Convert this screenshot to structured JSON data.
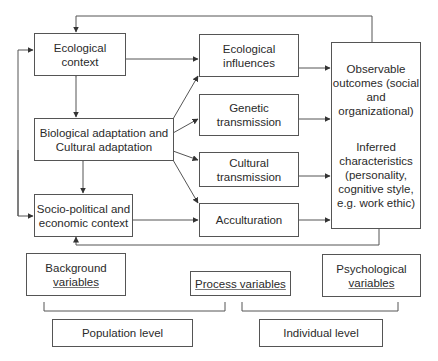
{
  "diagram": {
    "nodes": {
      "ecological_context": {
        "line1": "Ecological",
        "line2": "context"
      },
      "bio_cultural_adaptation": {
        "line1": "Biological adaptation and",
        "line2": "Cultural adaptation"
      },
      "sociopolitical_context": {
        "line1": "Socio-political and",
        "line2": "economic context"
      },
      "ecological_influences": {
        "line1": "Ecological",
        "line2": "influences"
      },
      "genetic_transmission": {
        "line1": "Genetic",
        "line2": "transmission"
      },
      "cultural_transmission": {
        "line1": "Cultural",
        "line2": "transmission"
      },
      "acculturation": {
        "line1": "Acculturation"
      },
      "outcomes": {
        "observable": [
          "Observable",
          "outcomes (social",
          "and",
          "organizational)"
        ],
        "inferred": [
          "Inferred",
          "characteristics",
          "(personality,",
          "cognitive style,",
          "e.g. work ethic)"
        ]
      }
    },
    "legend": {
      "background_variables": {
        "line1": "Background",
        "line2": "variables"
      },
      "process_variables": {
        "line1": "Process variables"
      },
      "psychological_variables": {
        "line1": "Psychological",
        "line2": "variables"
      },
      "population_level": {
        "line1": "Population level"
      },
      "individual_level": {
        "line1": "Individual level"
      }
    },
    "edges": [
      [
        "ecological_context",
        "ecological_influences"
      ],
      [
        "ecological_context",
        "bio_cultural_adaptation",
        "bidirectional"
      ],
      [
        "bio_cultural_adaptation",
        "sociopolitical_context",
        "bidirectional"
      ],
      [
        "bio_cultural_adaptation",
        "ecological_influences"
      ],
      [
        "bio_cultural_adaptation",
        "genetic_transmission"
      ],
      [
        "bio_cultural_adaptation",
        "cultural_transmission"
      ],
      [
        "bio_cultural_adaptation",
        "acculturation"
      ],
      [
        "sociopolitical_context",
        "acculturation"
      ],
      [
        "ecological_influences",
        "outcomes"
      ],
      [
        "genetic_transmission",
        "outcomes"
      ],
      [
        "cultural_transmission",
        "outcomes"
      ],
      [
        "acculturation",
        "outcomes"
      ],
      [
        "outcomes",
        "ecological_context",
        "feedback-top"
      ],
      [
        "outcomes",
        "sociopolitical_context",
        "feedback-bottom"
      ],
      [
        "left-rail",
        "ecological_context"
      ],
      [
        "left-rail",
        "sociopolitical_context"
      ]
    ],
    "colors": {
      "line": "#555555",
      "text": "#2a2a2a",
      "background": "#ffffff"
    }
  }
}
